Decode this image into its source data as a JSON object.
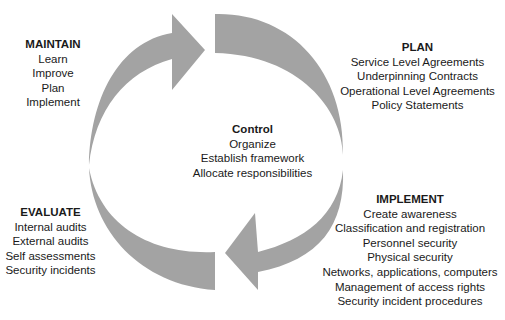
{
  "diagram": {
    "arrow_color": "#a3a3a3",
    "background": "#ffffff",
    "blocks": {
      "maintain": {
        "title": "MAINTAIN",
        "items": [
          "Learn",
          "Improve",
          "Plan",
          "Implement"
        ]
      },
      "plan": {
        "title": "PLAN",
        "items": [
          "Service Level Agreements",
          "Underpinning Contracts",
          "Operational Level Agreements",
          "Policy Statements"
        ]
      },
      "control": {
        "title": "Control",
        "items": [
          "Organize",
          "Establish framework",
          "Allocate responsibilities"
        ]
      },
      "evaluate": {
        "title": "EVALUATE",
        "items": [
          "Internal audits",
          "External audits",
          "Self assessments",
          "Security incidents"
        ]
      },
      "implement": {
        "title": "IMPLEMENT",
        "items": [
          "Create awareness",
          "Classification and registration",
          "Personnel security",
          "Physical security",
          "Networks, applications, computers",
          "Management of access rights",
          "Security incident procedures"
        ]
      }
    }
  }
}
